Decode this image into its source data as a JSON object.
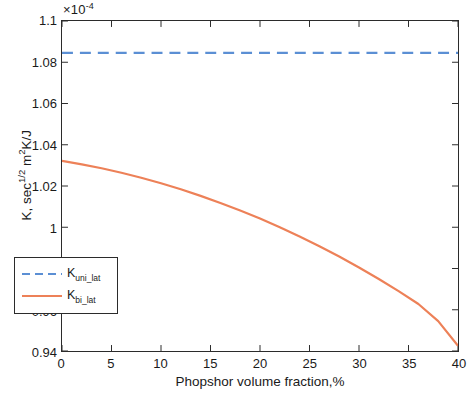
{
  "chart_data": {
    "type": "line",
    "title": "",
    "xlabel": "Phopshor volume fraction,%",
    "ylabel": "K, sec1/2 m2K/J",
    "ylabel_parts": {
      "prefix": "K, sec",
      "exponent": "1/2",
      "mid": " m",
      "sq": "2",
      "suffix": "K/J"
    },
    "y_multiplier": "×10",
    "y_multiplier_exponent": "-4",
    "y_multiplier_full": "×10-4",
    "xlim": [
      0,
      40
    ],
    "ylim": [
      0.94,
      1.1
    ],
    "xticks": [
      0,
      5,
      10,
      15,
      20,
      25,
      30,
      35,
      40
    ],
    "xtick_labels": [
      "0",
      "5",
      "10",
      "15",
      "20",
      "25",
      "30",
      "35",
      "40"
    ],
    "yticks": [
      0.94,
      0.96,
      0.98,
      1,
      1.02,
      1.04,
      1.06,
      1.08,
      1.1
    ],
    "ytick_labels": [
      "0.94",
      "0.96",
      "0.98",
      "1",
      "1.02",
      "1.04",
      "1.06",
      "1.08",
      "1.1"
    ],
    "grid": false,
    "legend_position": "lower left",
    "x": [
      0,
      2,
      4,
      6,
      8,
      10,
      12,
      14,
      16,
      18,
      20,
      22,
      24,
      26,
      28,
      30,
      32,
      34,
      36,
      38,
      40
    ],
    "series": [
      {
        "name": "K_uni_lat",
        "legend_label": "Kuni_lat",
        "legend_base": "K",
        "legend_sub": "uni_lat",
        "style": "dashed",
        "color": "#5B8FD4",
        "linewidth": 2.2,
        "values": [
          1.0845,
          1.0845,
          1.0845,
          1.0845,
          1.0845,
          1.0845,
          1.0845,
          1.0845,
          1.0845,
          1.0845,
          1.0845,
          1.0845,
          1.0845,
          1.0845,
          1.0845,
          1.0845,
          1.0845,
          1.0845,
          1.0845,
          1.0845,
          1.0845
        ]
      },
      {
        "name": "K_bi_lat",
        "legend_label": "Kbi_lat",
        "legend_base": "K",
        "legend_sub": "bi_lat",
        "style": "solid",
        "color": "#ED8158",
        "linewidth": 2.2,
        "values": [
          1.0322,
          1.0305,
          1.0286,
          1.0264,
          1.024,
          1.0213,
          1.0184,
          1.0152,
          1.0118,
          1.0081,
          1.0042,
          1.0,
          0.9955,
          0.9908,
          0.9858,
          0.9805,
          0.9749,
          0.969,
          0.9628,
          0.9545,
          0.9425
        ]
      }
    ]
  },
  "legend": {
    "entries": [
      {
        "base": "K",
        "sub": "uni_lat"
      },
      {
        "base": "K",
        "sub": "bi_lat"
      }
    ]
  }
}
